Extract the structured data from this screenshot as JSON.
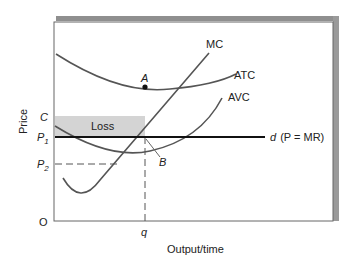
{
  "diagram": {
    "type": "economics-cost-curves",
    "y_axis_label": "Price",
    "x_axis_label": "Output/time",
    "origin_label": "O",
    "curves": {
      "mc": "MC",
      "atc": "ATC",
      "avc": "AVC",
      "demand_prefix": "d",
      "demand_suffix": "(P = MR)"
    },
    "y_ticks": {
      "c": "C",
      "p1": "P",
      "p1_sub": "1",
      "p2": "P",
      "p2_sub": "2"
    },
    "x_ticks": {
      "q": "q"
    },
    "points": {
      "a": "A",
      "b": "B"
    },
    "region": {
      "loss": "Loss"
    },
    "colors": {
      "loss_fill": "#d4d4d4",
      "frame_shadow": "#8f8f8f",
      "curve": "#555555",
      "demand_line": "#111111"
    }
  }
}
